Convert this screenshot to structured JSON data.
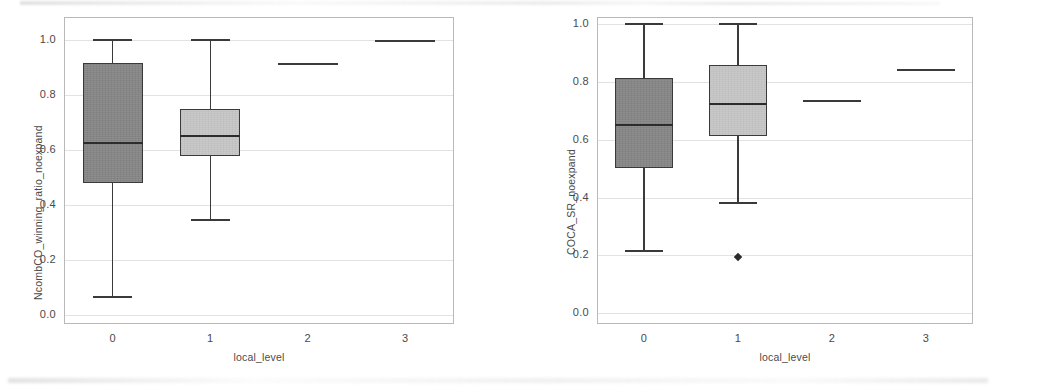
{
  "figure": {
    "background_color": "#ffffff",
    "panel_count": 2,
    "axis_text_color": "#4a4a4a",
    "gridline_color": "#e2e2e2",
    "frame_color": "#b9b9b9",
    "dark_box_color": "#818181",
    "light_box_color": "#c2c2c2",
    "line_color": "#3a3a3a"
  },
  "chart_data": [
    {
      "type": "box",
      "panel": "left",
      "title": "",
      "xlabel": "local_level",
      "ylabel": "NcombCO_winning_ratio_noexpand",
      "categories": [
        "0",
        "1",
        "2",
        "3"
      ],
      "ylim": [
        0.0,
        1.0
      ],
      "yticks": [
        "0.0",
        "0.2",
        "0.4",
        "0.6",
        "0.8",
        "1.0"
      ],
      "ytick_values": [
        0.0,
        0.2,
        0.4,
        0.6,
        0.8,
        1.0
      ],
      "grid": true,
      "legend": "none",
      "boxes": [
        {
          "category": "0",
          "fill": "#818181",
          "whisker_low": 0.065,
          "q1": 0.475,
          "median": 0.625,
          "q3": 0.915,
          "whisker_high": 1.0,
          "outliers": [],
          "degenerate": false
        },
        {
          "category": "1",
          "fill": "#c2c2c2",
          "whisker_low": 0.345,
          "q1": 0.575,
          "median": 0.652,
          "q3": 0.745,
          "whisker_high": 1.0,
          "outliers": [],
          "degenerate": false
        },
        {
          "category": "2",
          "fill": "#818181",
          "whisker_low": 0.915,
          "q1": 0.915,
          "median": 0.915,
          "q3": 0.915,
          "whisker_high": 0.915,
          "outliers": [],
          "degenerate": true
        },
        {
          "category": "3",
          "fill": "#c2c2c2",
          "whisker_low": 0.998,
          "q1": 0.998,
          "median": 0.998,
          "q3": 0.998,
          "whisker_high": 0.998,
          "outliers": [],
          "degenerate": true
        }
      ]
    },
    {
      "type": "box",
      "panel": "right",
      "title": "",
      "xlabel": "local_level",
      "ylabel": "COCA_SR_noexpand",
      "categories": [
        "0",
        "1",
        "2",
        "3"
      ],
      "ylim": [
        0.0,
        1.0
      ],
      "yticks": [
        "0.0",
        "0.2",
        "0.4",
        "0.6",
        "0.8",
        "1.0"
      ],
      "ytick_values": [
        0.0,
        0.2,
        0.4,
        0.6,
        0.8,
        1.0
      ],
      "grid": true,
      "legend": "none",
      "boxes": [
        {
          "category": "0",
          "fill": "#818181",
          "whisker_low": 0.215,
          "q1": 0.5,
          "median": 0.65,
          "q3": 0.81,
          "whisker_high": 1.0,
          "outliers": [],
          "degenerate": false
        },
        {
          "category": "1",
          "fill": "#c2c2c2",
          "whisker_low": 0.38,
          "q1": 0.61,
          "median": 0.722,
          "q3": 0.855,
          "whisker_high": 1.0,
          "outliers": [
            0.192
          ],
          "degenerate": false
        },
        {
          "category": "2",
          "fill": "#818181",
          "whisker_low": 0.735,
          "q1": 0.735,
          "median": 0.735,
          "q3": 0.735,
          "whisker_high": 0.735,
          "outliers": [],
          "degenerate": true
        },
        {
          "category": "3",
          "fill": "#c2c2c2",
          "whisker_low": 0.84,
          "q1": 0.84,
          "median": 0.84,
          "q3": 0.84,
          "whisker_high": 0.84,
          "outliers": [],
          "degenerate": true
        }
      ]
    }
  ]
}
